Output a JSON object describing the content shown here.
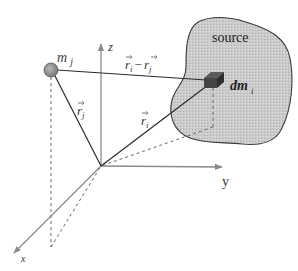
{
  "diagram": {
    "type": "vector-geometry",
    "axes": {
      "x": {
        "label": "x"
      },
      "y": {
        "label": "y"
      },
      "z": {
        "label": "z"
      }
    },
    "point_mass": {
      "label": "m",
      "subscript": "j"
    },
    "source": {
      "label": "source",
      "element": {
        "label": "dm",
        "subscript": "i"
      }
    },
    "vectors": {
      "r_j": {
        "symbol": "r",
        "subscript": "j"
      },
      "r_i": {
        "symbol": "r",
        "subscript": "i"
      },
      "r_diff": {
        "symbol_a": "r",
        "sub_a": "i",
        "minus": "−",
        "symbol_b": "r",
        "sub_b": "j"
      }
    },
    "colors": {
      "axis": "#8a8a8a",
      "vector": "#2a2a2a",
      "dashed": "#6a6a6a",
      "source_fill": "#c8c8c8",
      "source_stroke": "#3a3a3a",
      "mass_fill": "#9a9a9a",
      "cube": "#3a3a3a"
    }
  }
}
